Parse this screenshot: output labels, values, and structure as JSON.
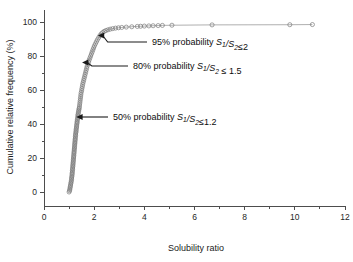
{
  "figure": {
    "background_color": "#ffffff",
    "line_color": "#8c8c8c",
    "marker_color": "#7a7a7a",
    "axis_color": "#4d4d4d",
    "text_color": "#1a1a1a"
  },
  "chart_data": {
    "type": "line",
    "title": "",
    "subtitle": "",
    "xlabel": "Solubility ratio",
    "ylabel": "Cumulative relative frequency (%)",
    "xlim": [
      0,
      12
    ],
    "ylim": [
      -5,
      105
    ],
    "xticks": [
      0,
      2,
      4,
      6,
      8,
      10,
      12
    ],
    "xtick_labels": [
      "0",
      "2",
      "4",
      "6",
      "8",
      "10",
      "12"
    ],
    "xminor_ticks": [
      1,
      3,
      5,
      7,
      9,
      11
    ],
    "yticks": [
      0,
      20,
      40,
      60,
      80,
      100
    ],
    "ytick_labels": [
      "0",
      "20",
      "40",
      "60",
      "80",
      "100"
    ],
    "yminor_ticks": [
      10,
      30,
      50,
      70,
      90
    ],
    "grid": false,
    "legend": null,
    "legend_position": "none",
    "marker": "open-circle",
    "marker_size": 3.0,
    "series": [
      {
        "name": "Cumulative relative frequency",
        "x": [
          1.0,
          1.02,
          1.03,
          1.04,
          1.05,
          1.06,
          1.07,
          1.08,
          1.09,
          1.1,
          1.1,
          1.11,
          1.12,
          1.12,
          1.13,
          1.13,
          1.14,
          1.14,
          1.15,
          1.15,
          1.16,
          1.16,
          1.17,
          1.17,
          1.18,
          1.18,
          1.19,
          1.19,
          1.2,
          1.2,
          1.21,
          1.21,
          1.22,
          1.22,
          1.23,
          1.23,
          1.24,
          1.24,
          1.25,
          1.25,
          1.26,
          1.26,
          1.27,
          1.28,
          1.28,
          1.29,
          1.3,
          1.3,
          1.31,
          1.32,
          1.32,
          1.33,
          1.34,
          1.35,
          1.35,
          1.36,
          1.37,
          1.38,
          1.39,
          1.4,
          1.41,
          1.42,
          1.43,
          1.44,
          1.45,
          1.46,
          1.47,
          1.48,
          1.5,
          1.51,
          1.53,
          1.54,
          1.56,
          1.58,
          1.6,
          1.62,
          1.64,
          1.66,
          1.68,
          1.7,
          1.72,
          1.75,
          1.78,
          1.8,
          1.83,
          1.86,
          1.89,
          1.92,
          1.95,
          1.98,
          2.01,
          2.05,
          2.09,
          2.13,
          2.18,
          2.23,
          2.28,
          2.34,
          2.4,
          2.47,
          2.55,
          2.64,
          2.74,
          2.85,
          2.97,
          3.1,
          3.28,
          3.5,
          3.72,
          3.85,
          4.0,
          4.18,
          4.35,
          4.55,
          4.72,
          5.1,
          6.7,
          9.8,
          10.7
        ],
        "y": [
          0.0,
          0.8,
          1.6,
          2.5,
          3.3,
          4.1,
          5.0,
          5.8,
          6.6,
          7.5,
          8.3,
          9.1,
          10.0,
          10.8,
          11.6,
          12.5,
          13.3,
          14.1,
          15.0,
          15.8,
          16.6,
          17.5,
          18.3,
          19.1,
          20.0,
          20.8,
          21.6,
          22.5,
          23.3,
          24.1,
          25.0,
          25.8,
          26.6,
          27.5,
          28.3,
          29.1,
          30.0,
          30.8,
          31.6,
          32.5,
          33.3,
          34.1,
          35.0,
          35.8,
          36.6,
          37.5,
          38.3,
          39.1,
          40.0,
          40.8,
          41.6,
          42.5,
          43.3,
          44.1,
          45.0,
          45.8,
          46.6,
          47.5,
          48.3,
          49.1,
          50.0,
          51.2,
          52.4,
          53.6,
          54.8,
          56.0,
          57.2,
          58.4,
          59.6,
          60.8,
          62.0,
          63.2,
          64.4,
          65.6,
          66.8,
          68.0,
          69.2,
          70.4,
          71.6,
          72.8,
          74.0,
          75.2,
          76.4,
          77.6,
          78.8,
          80.0,
          81.2,
          82.4,
          83.6,
          84.8,
          86.0,
          87.2,
          88.4,
          89.6,
          90.8,
          92.0,
          93.0,
          93.8,
          94.5,
          95.0,
          95.4,
          95.8,
          96.1,
          96.4,
          96.6,
          96.8,
          97.0,
          97.2,
          97.4,
          97.5,
          97.6,
          97.7,
          97.8,
          97.9,
          98.0,
          98.1,
          98.3,
          98.4,
          98.5
        ]
      }
    ],
    "annotations": [
      {
        "id": "annotation-95",
        "text_parts": {
          "prefix": "95% probability ",
          "var1": "S",
          "sub1": "1",
          "slash": "/",
          "var2": "S",
          "sub2": "2",
          "suffix": "≤2"
        },
        "full_text": "95% probability S1/S2≤2",
        "probability": 95,
        "ratio_value": 2,
        "points_to": {
          "x": 2.1,
          "y": 96.0
        }
      },
      {
        "id": "annotation-80",
        "text_parts": {
          "prefix": "80% probability ",
          "var1": "S",
          "sub1": "1",
          "slash": "/",
          "var2": "S",
          "sub2": "2",
          "suffix": " ≤ 1.5"
        },
        "full_text": "80% probability S1/S2 ≤ 1.5",
        "probability": 80,
        "ratio_value": 1.5,
        "points_to": {
          "x": 1.47,
          "y": 79.5
        }
      },
      {
        "id": "annotation-50",
        "text_parts": {
          "prefix": "50% probability ",
          "var1": "S",
          "sub1": "1",
          "slash": "/",
          "var2": "S",
          "sub2": "2",
          "suffix": "≤1.2"
        },
        "full_text": "50% probability S1/S2≤1.2",
        "probability": 50,
        "ratio_value": 1.2,
        "points_to": {
          "x": 1.24,
          "y": 50.0
        }
      }
    ]
  }
}
